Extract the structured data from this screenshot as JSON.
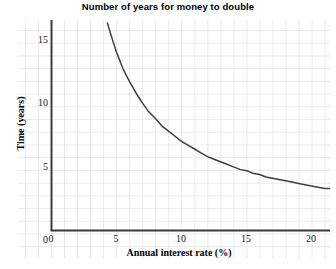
{
  "chart_data": {
    "type": "line",
    "title": "Number of years for money to double",
    "xlabel": "Annual interest rate (%)",
    "ylabel": "Time (years)",
    "xlim": [
      0,
      21.5
    ],
    "ylim": [
      0,
      16.4
    ],
    "xticks": [
      0,
      5,
      10,
      15,
      20
    ],
    "xticklabels": [
      "0",
      "5",
      "10",
      "15",
      "20"
    ],
    "yticks": [
      0,
      5,
      10,
      15
    ],
    "yticklabels": [
      "0",
      "5",
      "10",
      "15"
    ],
    "grid": true,
    "grid_style": "graph-paper minor grid, 1 unit spacing",
    "legend": "none",
    "series": [
      {
        "name": "Doubling time (Rule of 70)",
        "formula": "t = 70 / r",
        "color": "#3f3f3f",
        "x": [
          4.3,
          4.5,
          5.0,
          5.5,
          6.0,
          6.5,
          7.0,
          7.5,
          8.0,
          8.5,
          9.0,
          9.5,
          10.0,
          10.5,
          11.0,
          11.5,
          12.0,
          12.5,
          13.0,
          13.5,
          14.0,
          14.5,
          15.0,
          15.5,
          16.0,
          16.5,
          17.0,
          17.5,
          18.0,
          18.5,
          19.0,
          19.5,
          20.0,
          20.5,
          21.0,
          21.4
        ],
        "y": [
          16.3,
          15.6,
          14.0,
          12.7,
          11.7,
          10.8,
          10.0,
          9.3,
          8.8,
          8.2,
          7.8,
          7.4,
          7.0,
          6.7,
          6.4,
          6.1,
          5.8,
          5.6,
          5.4,
          5.2,
          5.0,
          4.8,
          4.7,
          4.5,
          4.4,
          4.2,
          4.1,
          4.0,
          3.9,
          3.8,
          3.7,
          3.6,
          3.5,
          3.4,
          3.3,
          3.3
        ]
      }
    ]
  },
  "colors": {
    "curve": "#3f3f3f",
    "axis": "#3a3a3a",
    "grid_minor": "#c9cdd6",
    "grid_major": "#aeb4c0",
    "background": "#ffffff"
  }
}
